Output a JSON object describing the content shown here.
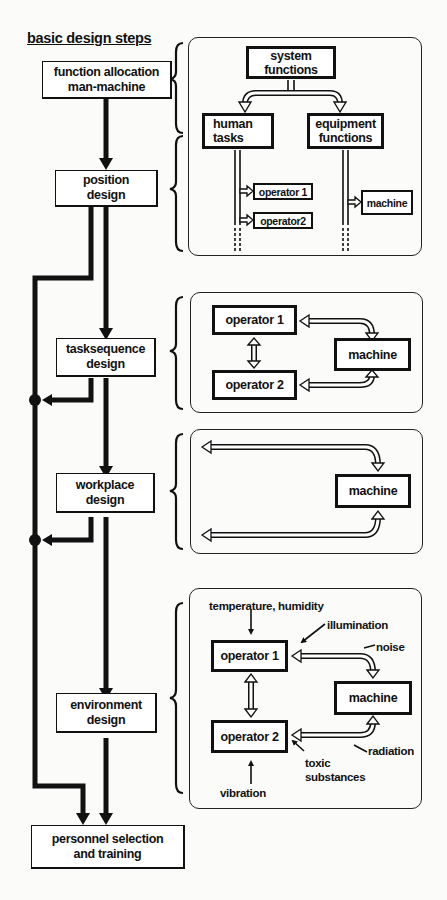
{
  "title": "basic design steps",
  "steps": [
    {
      "line1": "function allocation",
      "line2": "man-machine"
    },
    {
      "line1": "position",
      "line2": "design"
    },
    {
      "line1": "tasksequence",
      "line2": "design"
    },
    {
      "line1": "workplace",
      "line2": "design"
    },
    {
      "line1": "environment",
      "line2": "design"
    },
    {
      "line1": "personnel selection",
      "line2": "and training"
    }
  ],
  "panel1": {
    "system": {
      "line1": "system",
      "line2": "functions"
    },
    "human": {
      "line1": "human",
      "line2": "tasks"
    },
    "equipment": {
      "line1": "equipment",
      "line2": "functions"
    },
    "operator1": "operator 1",
    "operator2": "operator2",
    "machine": "machine"
  },
  "panel2": {
    "operator1": "operator 1",
    "operator2": "operator 2",
    "machine": "machine"
  },
  "panel3": {
    "machine": "machine"
  },
  "panel4": {
    "operator1": "operator 1",
    "operator2": "operator 2",
    "machine": "machine",
    "factors": {
      "temperature": "temperature, humidity",
      "illumination": "illumination",
      "noise": "noise",
      "radiation": "radiation",
      "toxic1": "toxic",
      "toxic2": "substances",
      "vibration": "vibration"
    }
  },
  "colors": {
    "ink": "#111111",
    "paper": "#fbfbfa"
  }
}
